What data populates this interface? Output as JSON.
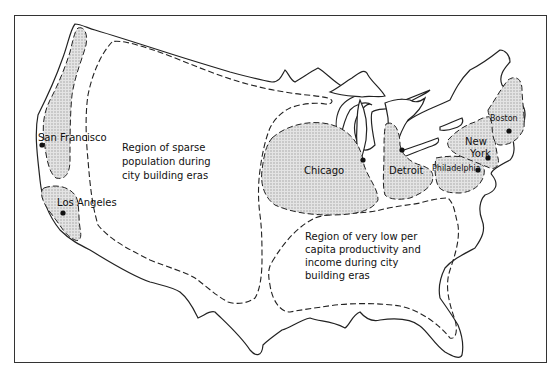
{
  "map": {
    "regions": [
      {
        "id": "sparse",
        "lines": [
          "Region of sparse",
          "population during",
          "city building eras"
        ]
      },
      {
        "id": "low-income",
        "lines": [
          "Region of very low per",
          "capita productivity and",
          "income during city",
          "building eras"
        ]
      }
    ],
    "cities": [
      {
        "name": "San Francisco"
      },
      {
        "name": "Los Angeles"
      },
      {
        "name": "Chicago"
      },
      {
        "name": "Detroit"
      },
      {
        "name": "Philadelphia"
      },
      {
        "name": "New"
      },
      {
        "name": "York"
      },
      {
        "name": "Boston"
      }
    ],
    "colors": {
      "outline": "#222222",
      "shade": "#d9d9d9",
      "dot": "#111111"
    }
  }
}
